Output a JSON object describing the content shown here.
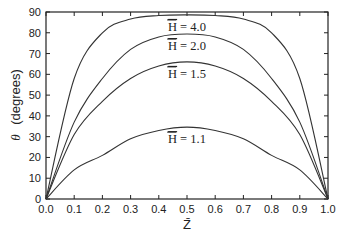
{
  "chart_data": {
    "type": "line",
    "title": "",
    "xlabel": "Z̄",
    "ylabel_symbol": "θ",
    "ylabel_unit": "(degrees)",
    "xlim": [
      0.0,
      1.0
    ],
    "ylim": [
      0,
      90
    ],
    "xticks": [
      "0.0",
      "0.1",
      "0.2",
      "0.3",
      "0.4",
      "0.5",
      "0.6",
      "0.7",
      "0.8",
      "0.9",
      "1.0"
    ],
    "yticks": [
      "0",
      "10",
      "20",
      "30",
      "40",
      "50",
      "60",
      "70",
      "80",
      "90"
    ],
    "grid": false,
    "legend": "inline labels",
    "x": [
      0.0,
      0.1,
      0.2,
      0.3,
      0.4,
      0.5,
      0.6,
      0.7,
      0.8,
      0.9,
      1.0
    ],
    "series": [
      {
        "name": "H̄ = 4.0",
        "label_prefix": "H",
        "label_value": "= 4.0",
        "values": [
          0,
          58,
          80,
          86.6,
          88.3,
          88.6,
          88.3,
          86.6,
          80,
          58,
          0
        ]
      },
      {
        "name": "H̄ = 2.0",
        "label_prefix": "H",
        "label_value": "= 2.0",
        "values": [
          0,
          37,
          58,
          72,
          78,
          79.4,
          78,
          72,
          58,
          37,
          0
        ]
      },
      {
        "name": "H̄ = 1.5",
        "label_prefix": "H",
        "label_value": "= 1.5",
        "values": [
          0,
          31,
          47,
          58,
          64,
          66,
          64,
          58,
          47,
          31,
          0
        ]
      },
      {
        "name": "H̄ = 1.1",
        "label_prefix": "H",
        "label_value": "= 1.1",
        "values": [
          0,
          14,
          21,
          29,
          33,
          34.6,
          33,
          29,
          21,
          14,
          0
        ]
      }
    ]
  }
}
